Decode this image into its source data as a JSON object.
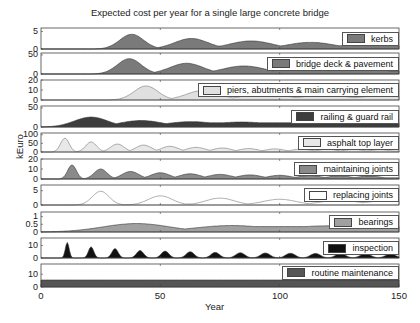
{
  "chart_data": {
    "type": "area",
    "title": "Expected cost per year for a single large concrete bridge",
    "xlabel": "Year",
    "ylabel": "kEuro",
    "xlim": [
      0,
      150
    ],
    "xticks": [
      0,
      50,
      100,
      150
    ],
    "grid": false,
    "legend_position": "inside-right of each panel",
    "panels": [
      {
        "name": "kerbs",
        "ylim": [
          0,
          6
        ],
        "yticks": [
          "5",
          "0"
        ],
        "color": "#7a7a7a",
        "peaks": [
          {
            "x": 38,
            "y": 4.2,
            "w": 5
          },
          {
            "x": 63,
            "y": 3.0,
            "w": 7
          },
          {
            "x": 88,
            "y": 2.3,
            "w": 9
          },
          {
            "x": 113,
            "y": 1.9,
            "w": 10
          },
          {
            "x": 138,
            "y": 1.6,
            "w": 12
          }
        ],
        "baseline_after": 0.9
      },
      {
        "name": "bridge deck & pavement",
        "ylim": [
          0,
          55
        ],
        "yticks": [
          "50",
          "0"
        ],
        "color": "#7a7a7a",
        "peaks": [
          {
            "x": 37,
            "y": 40,
            "w": 5
          },
          {
            "x": 61,
            "y": 28,
            "w": 7
          },
          {
            "x": 85,
            "y": 21,
            "w": 9
          },
          {
            "x": 109,
            "y": 17,
            "w": 10
          },
          {
            "x": 133,
            "y": 15,
            "w": 12
          }
        ],
        "baseline_after": 8
      },
      {
        "name": "piers, abutments & main carrying element",
        "ylim": [
          0,
          20
        ],
        "yticks": [
          "20",
          "10",
          "0"
        ],
        "color": "#e0e0e0",
        "peaks": [
          {
            "x": 44,
            "y": 14,
            "w": 5
          },
          {
            "x": 68,
            "y": 9.5,
            "w": 7
          },
          {
            "x": 94,
            "y": 6.5,
            "w": 9
          },
          {
            "x": 119,
            "y": 5,
            "w": 10
          },
          {
            "x": 144,
            "y": 4.2,
            "w": 12
          }
        ],
        "baseline_after": 1.5
      },
      {
        "name": "railing & guard rail",
        "ylim": [
          0,
          55
        ],
        "yticks": [
          "50",
          "0"
        ],
        "color": "#3d3d3d",
        "peaks": [
          {
            "x": 21,
            "y": 26,
            "w": 7
          },
          {
            "x": 42,
            "y": 17,
            "w": 9
          },
          {
            "x": 63,
            "y": 14,
            "w": 11
          },
          {
            "x": 84,
            "y": 13,
            "w": 13
          }
        ],
        "baseline_after": 11
      },
      {
        "name": "asphalt top layer",
        "ylim": [
          0,
          110
        ],
        "yticks": [
          "100",
          "50",
          "0"
        ],
        "color": "#e8e8e8",
        "peaks": [
          {
            "x": 10,
            "y": 80,
            "w": 1.8
          },
          {
            "x": 21,
            "y": 58,
            "w": 2.3
          },
          {
            "x": 32,
            "y": 46,
            "w": 2.8
          },
          {
            "x": 43,
            "y": 40,
            "w": 3.3
          },
          {
            "x": 54,
            "y": 33,
            "w": 3.6
          },
          {
            "x": 65,
            "y": 27,
            "w": 4
          },
          {
            "x": 76,
            "y": 23,
            "w": 4
          },
          {
            "x": 87,
            "y": 20,
            "w": 4
          },
          {
            "x": 98,
            "y": 18,
            "w": 4
          },
          {
            "x": 109,
            "y": 17,
            "w": 4
          },
          {
            "x": 120,
            "y": 16,
            "w": 4
          },
          {
            "x": 131,
            "y": 15,
            "w": 4
          },
          {
            "x": 142,
            "y": 14,
            "w": 4
          }
        ],
        "baseline_after": 6
      },
      {
        "name": "maintaining joints",
        "ylim": [
          0,
          20
        ],
        "yticks": [
          "20",
          "10",
          "0"
        ],
        "color": "#8a8a8a",
        "peaks": [
          {
            "x": 13,
            "y": 14,
            "w": 1.8
          },
          {
            "x": 25,
            "y": 10,
            "w": 2.7
          },
          {
            "x": 37.5,
            "y": 7.5,
            "w": 3.5
          },
          {
            "x": 50,
            "y": 6.2,
            "w": 4
          },
          {
            "x": 62.5,
            "y": 5.2,
            "w": 4.5
          },
          {
            "x": 75,
            "y": 4.6,
            "w": 5
          },
          {
            "x": 87.5,
            "y": 4.1,
            "w": 5
          },
          {
            "x": 100,
            "y": 3.7,
            "w": 5
          },
          {
            "x": 112.5,
            "y": 3.4,
            "w": 5
          },
          {
            "x": 125,
            "y": 3.2,
            "w": 5
          },
          {
            "x": 137.5,
            "y": 3.0,
            "w": 5
          }
        ],
        "baseline_after": 1.2
      },
      {
        "name": "replacing joints",
        "ylim": [
          0,
          7
        ],
        "yticks": [
          "5",
          "0"
        ],
        "color": "#ffffff",
        "peaks": [
          {
            "x": 25,
            "y": 4.8,
            "w": 3.5
          },
          {
            "x": 50,
            "y": 3.2,
            "w": 5
          },
          {
            "x": 75,
            "y": 2.4,
            "w": 6
          },
          {
            "x": 100,
            "y": 2.0,
            "w": 7
          },
          {
            "x": 125,
            "y": 1.7,
            "w": 8
          },
          {
            "x": 145,
            "y": 1.5,
            "w": 9
          }
        ],
        "baseline_after": 0.4
      },
      {
        "name": "bearings",
        "ylim": [
          0,
          1.3
        ],
        "yticks": [
          "1",
          "0.5",
          "0"
        ],
        "color": "#a0a0a0",
        "peaks": [
          {
            "x": 40,
            "y": 0.55,
            "w": 14
          },
          {
            "x": 80,
            "y": 0.42,
            "w": 16
          },
          {
            "x": 120,
            "y": 0.4,
            "w": 18
          }
        ],
        "baseline_after": 0.35
      },
      {
        "name": "inspection",
        "ylim": [
          0,
          16
        ],
        "yticks": [
          "10",
          "0"
        ],
        "color": "#111111",
        "peaks": [
          {
            "x": 11,
            "y": 12.5,
            "w": 0.8
          },
          {
            "x": 21,
            "y": 9,
            "w": 1.1
          },
          {
            "x": 31,
            "y": 7.5,
            "w": 1.3
          },
          {
            "x": 41.5,
            "y": 6,
            "w": 1.5
          },
          {
            "x": 52,
            "y": 5.5,
            "w": 1.6
          },
          {
            "x": 62.5,
            "y": 5,
            "w": 1.7
          },
          {
            "x": 73,
            "y": 4.5,
            "w": 1.8
          },
          {
            "x": 83.5,
            "y": 4.2,
            "w": 1.9
          },
          {
            "x": 94,
            "y": 4,
            "w": 2
          },
          {
            "x": 104.5,
            "y": 3.8,
            "w": 2
          },
          {
            "x": 115,
            "y": 3.6,
            "w": 2.1
          },
          {
            "x": 125.5,
            "y": 3.5,
            "w": 2.1
          },
          {
            "x": 136,
            "y": 3.3,
            "w": 2.2
          },
          {
            "x": 146.5,
            "y": 3.2,
            "w": 2.2
          }
        ],
        "baseline_after": 0
      },
      {
        "name": "routine maintenance",
        "ylim": [
          0,
          18
        ],
        "yticks": [
          "10",
          "0"
        ],
        "color": "#555555",
        "constant": 5.5
      }
    ]
  },
  "legend_labels": [
    "kerbs",
    "bridge deck & pavement",
    "piers, abutments & main carrying element",
    "railing & guard rail",
    "asphalt top layer",
    "maintaining joints",
    "replacing joints",
    "bearings",
    "inspection",
    "routine maintenance"
  ],
  "xtick_labels": [
    "0",
    "50",
    "100",
    "150"
  ]
}
